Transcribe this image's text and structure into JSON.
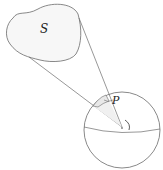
{
  "diagram": {
    "labels": {
      "surface": "S",
      "patch": "P"
    },
    "elements": [
      "surface S (blob)",
      "cone from sphere center to S",
      "patch P on sphere surface",
      "sphere with equator",
      "solid-angle arc at center"
    ],
    "colors": {
      "stroke": "#6b6b6b",
      "fill": "#f7f7f7",
      "patch_fill": "#eeeeee",
      "text": "#222222"
    }
  }
}
